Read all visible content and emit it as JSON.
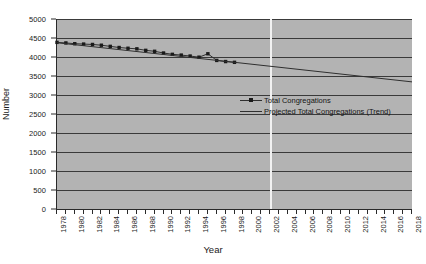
{
  "chart_data": {
    "type": "line",
    "title": "",
    "xlabel": "Year",
    "ylabel": "Number",
    "xlim": [
      1978,
      2018
    ],
    "ylim": [
      0,
      5000
    ],
    "ytick_step": 500,
    "xtick_step": 1,
    "xlabel_step": 2,
    "grid": true,
    "legend_position": "center",
    "plot_background": "#b3b3b3",
    "line_color": "#2f2f2f",
    "marker_color": "#1a1a1a",
    "marker_line_color": "#f2f2f2",
    "marker_line_year": 2002,
    "y_ticks": [
      0,
      500,
      1000,
      1500,
      2000,
      2500,
      3000,
      3500,
      4000,
      4500,
      5000
    ],
    "x_ticks": [
      1978,
      1979,
      1980,
      1981,
      1982,
      1983,
      1984,
      1985,
      1986,
      1987,
      1988,
      1989,
      1990,
      1991,
      1992,
      1993,
      1994,
      1995,
      1996,
      1997,
      1998,
      1999,
      2000,
      2001,
      2002,
      2003,
      2004,
      2005,
      2006,
      2007,
      2008,
      2009,
      2010,
      2011,
      2012,
      2013,
      2014,
      2015,
      2016,
      2017,
      2018
    ],
    "x_tick_labels": [
      1978,
      1980,
      1982,
      1984,
      1986,
      1988,
      1990,
      1992,
      1994,
      1996,
      1998,
      2000,
      2002,
      2004,
      2006,
      2008,
      2010,
      2012,
      2014,
      2016,
      2018
    ],
    "series": [
      {
        "name": "Total Congregations",
        "marker": true,
        "x": [
          1978,
          1979,
          1980,
          1981,
          1982,
          1983,
          1984,
          1985,
          1986,
          1987,
          1988,
          1989,
          1990,
          1991,
          1992,
          1993,
          1994,
          1995,
          1996,
          1997,
          1998
        ],
        "values": [
          4385,
          4370,
          4350,
          4340,
          4330,
          4310,
          4280,
          4250,
          4230,
          4215,
          4175,
          4150,
          4105,
          4070,
          4050,
          4025,
          3995,
          4085,
          3910,
          3880,
          3860
        ]
      },
      {
        "name": "Projected Total Congregations (Trend)",
        "marker": false,
        "x": [
          1978,
          2018
        ],
        "values": [
          4375,
          3345
        ]
      }
    ]
  },
  "legend": {
    "items": [
      {
        "label": "Total Congregations",
        "marker": true
      },
      {
        "label": "Projected Total Congregations (Trend)",
        "marker": false
      }
    ]
  },
  "axes": {
    "y_title": "Number",
    "x_title": "Year"
  }
}
